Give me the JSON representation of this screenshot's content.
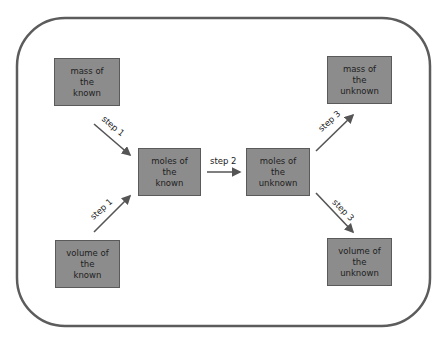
{
  "diagram": {
    "nodes": [
      {
        "id": "mass-known",
        "lines": [
          "mass of",
          "the",
          "known"
        ]
      },
      {
        "id": "volume-known",
        "lines": [
          "volume of",
          "the",
          "known"
        ]
      },
      {
        "id": "moles-known",
        "lines": [
          "moles of",
          "the",
          "known"
        ]
      },
      {
        "id": "moles-unknown",
        "lines": [
          "moles of",
          "the",
          "unknown"
        ]
      },
      {
        "id": "mass-unknown",
        "lines": [
          "mass of",
          "the",
          "unknown"
        ]
      },
      {
        "id": "volume-unknown",
        "lines": [
          "volume of",
          "the",
          "unknown"
        ]
      }
    ],
    "edges": [
      {
        "from": "mass-known",
        "to": "moles-known",
        "label": "step 1"
      },
      {
        "from": "volume-known",
        "to": "moles-known",
        "label": "step 1"
      },
      {
        "from": "moles-known",
        "to": "moles-unknown",
        "label": "step 2"
      },
      {
        "from": "moles-unknown",
        "to": "mass-unknown",
        "label": "step 3"
      },
      {
        "from": "moles-unknown",
        "to": "volume-unknown",
        "label": "step 3"
      }
    ],
    "colors": {
      "box_fill": "#8c8c8c",
      "frame": "#555555",
      "arrow": "#555555"
    }
  }
}
